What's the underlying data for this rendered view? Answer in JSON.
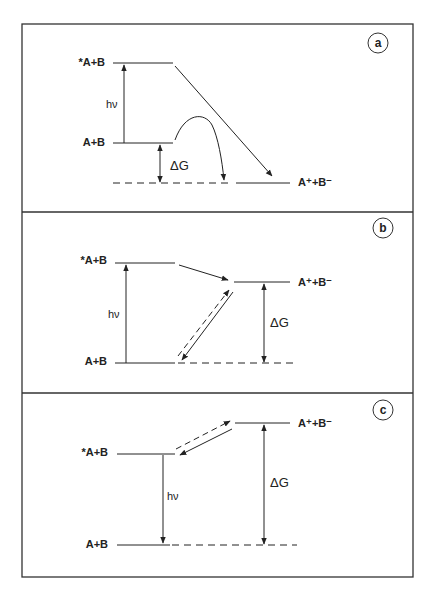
{
  "figure": {
    "panels": [
      {
        "id": "a",
        "letter": "a",
        "levels": {
          "excited": "*A+B",
          "ground": "A+B",
          "ion_pair": "A⁺+B⁻"
        },
        "labels": {
          "photon": "hν",
          "delta_g": "ΔG"
        }
      },
      {
        "id": "b",
        "letter": "b",
        "levels": {
          "excited": "*A+B",
          "ground": "A+B",
          "ion_pair": "A⁺+B⁻"
        },
        "labels": {
          "photon": "hν",
          "delta_g": "ΔG"
        }
      },
      {
        "id": "c",
        "letter": "c",
        "levels": {
          "excited": "*A+B",
          "ground": "A+B",
          "ion_pair": "A⁺+B⁻"
        },
        "labels": {
          "photon": "hν",
          "delta_g": "ΔG"
        }
      }
    ],
    "colors": {
      "line": "#222222",
      "frame": "#333333",
      "background": "#ffffff"
    }
  }
}
